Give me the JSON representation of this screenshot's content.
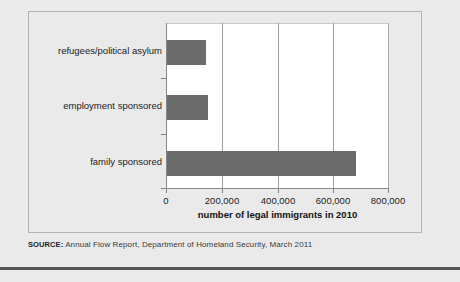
{
  "source": {
    "label": "SOURCE:",
    "text": " Annual Flow Report, Department of Homeland Security, March 2011"
  },
  "colors": {
    "bar_fill": "#6b6b6b",
    "page_background": "#eaeaea",
    "plot_background": "#ffffff",
    "axis": "#878787",
    "gridline": "#9e9e9e",
    "bottom_rule": "#575757"
  },
  "chart_data": {
    "type": "bar",
    "orientation": "horizontal",
    "title": "",
    "subtitle": "",
    "xlabel": "number of legal immigrants in 2010",
    "ylabel": "",
    "categories": [
      "family sponsored",
      "employment sponsored",
      "refugees/political asylum"
    ],
    "values": [
      680000,
      150000,
      145000
    ],
    "series": [
      {
        "name": "number of legal immigrants in 2010",
        "values": [
          680000,
          150000,
          145000
        ]
      }
    ],
    "xlim": [
      0,
      800000
    ],
    "xticks": [
      0,
      200000,
      400000,
      600000,
      800000
    ],
    "xtick_labels": [
      "0",
      "200,000",
      "400,000",
      "600,000",
      "800,000"
    ],
    "grid": true,
    "grid_axis": "x",
    "legend": false,
    "legend_position": "none",
    "annotations": []
  }
}
